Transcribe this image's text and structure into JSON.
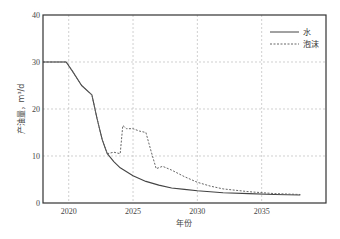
{
  "chart_data": {
    "type": "line",
    "title": "",
    "xlabel": "年份",
    "ylabel": "产油量，m³/d",
    "xlim": [
      2018,
      2040
    ],
    "ylim": [
      0,
      40
    ],
    "xticks": [
      2020,
      2025,
      2030,
      2035
    ],
    "yticks": [
      0,
      10,
      20,
      30,
      40
    ],
    "grid": true,
    "legend_position": "upper right",
    "series": [
      {
        "name": "水",
        "style": "solid",
        "color": "#444444",
        "x": [
          2018,
          2019,
          2019.8,
          2020.3,
          2021,
          2021.8,
          2022.2,
          2022.6,
          2023,
          2023.5,
          2024,
          2025,
          2026,
          2027,
          2028,
          2029,
          2030,
          2032,
          2034,
          2036,
          2038
        ],
        "y": [
          30,
          30,
          30,
          28,
          25,
          23,
          18,
          13.5,
          10.5,
          8.8,
          7.5,
          5.8,
          4.6,
          3.8,
          3.2,
          2.9,
          2.6,
          2.2,
          2.0,
          1.8,
          1.7
        ]
      },
      {
        "name": "泡沫",
        "style": "dashed",
        "color": "#666666",
        "x": [
          2018,
          2019,
          2019.8,
          2020.3,
          2021,
          2021.8,
          2022.2,
          2022.6,
          2023,
          2023.5,
          2024,
          2024.2,
          2024.5,
          2025,
          2025.5,
          2026,
          2026.4,
          2026.8,
          2027.3,
          2028,
          2029,
          2030,
          2031,
          2032,
          2034,
          2036,
          2038
        ],
        "y": [
          30,
          30,
          30,
          28,
          25,
          23,
          18,
          13.5,
          10.5,
          10.8,
          10.5,
          16.5,
          15.8,
          15.8,
          15.3,
          15,
          11,
          7.3,
          7.8,
          7,
          5.6,
          4.4,
          3.6,
          3.0,
          2.4,
          2.0,
          1.8
        ]
      }
    ]
  },
  "legend": {
    "items": [
      {
        "label": "水",
        "style": "solid"
      },
      {
        "label": "泡沫",
        "style": "dashed"
      }
    ]
  },
  "axes": {
    "xlabel": "年份",
    "ylabel": "产油量，m³/d"
  }
}
